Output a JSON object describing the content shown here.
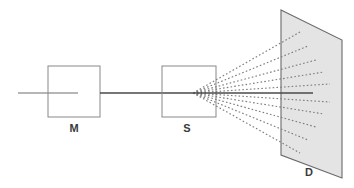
{
  "figure": {
    "width": 354,
    "height": 188,
    "background_color": "#ffffff"
  },
  "colors": {
    "outline": "#888888",
    "beam": "#4a4a4a",
    "ray": "#7d7d7d",
    "detector_fill": "#e4e4e4",
    "detector_stroke": "#6a6a6a",
    "label_text": "#3a3a3a"
  },
  "components": {
    "monochromator": {
      "label": "M",
      "label_x": 74,
      "label_y": 129,
      "box": {
        "x": 48,
        "y": 66,
        "width": 52,
        "height": 51
      }
    },
    "sample": {
      "label": "S",
      "label_x": 187,
      "label_y": 129,
      "box": {
        "x": 162,
        "y": 66,
        "width": 54,
        "height": 51
      }
    },
    "detector": {
      "label": "D",
      "label_x": 309,
      "label_y": 173,
      "plane_points": "281,10 342,40 342,178 281,155"
    }
  },
  "beam": {
    "incident_segment": {
      "x1": 18,
      "y1": 93,
      "x2": 78,
      "y2": 93
    },
    "between_segment": {
      "x1": 100,
      "y1": 93,
      "x2": 193,
      "y2": 93
    },
    "transmitted_segment": {
      "x1": 193,
      "y1": 93,
      "x2": 313,
      "y2": 93
    },
    "axis_y": 93,
    "scatter_origin_x": 193,
    "scatter_origin_y": 93
  },
  "scattered_rays": {
    "count": 10,
    "origin": {
      "x": 193,
      "y": 93
    },
    "endpoints": [
      {
        "x": 300,
        "y": 32
      },
      {
        "x": 308,
        "y": 46
      },
      {
        "x": 316,
        "y": 60
      },
      {
        "x": 324,
        "y": 72
      },
      {
        "x": 330,
        "y": 84
      },
      {
        "x": 330,
        "y": 102
      },
      {
        "x": 324,
        "y": 114
      },
      {
        "x": 316,
        "y": 127
      },
      {
        "x": 308,
        "y": 140
      },
      {
        "x": 300,
        "y": 153
      }
    ]
  }
}
